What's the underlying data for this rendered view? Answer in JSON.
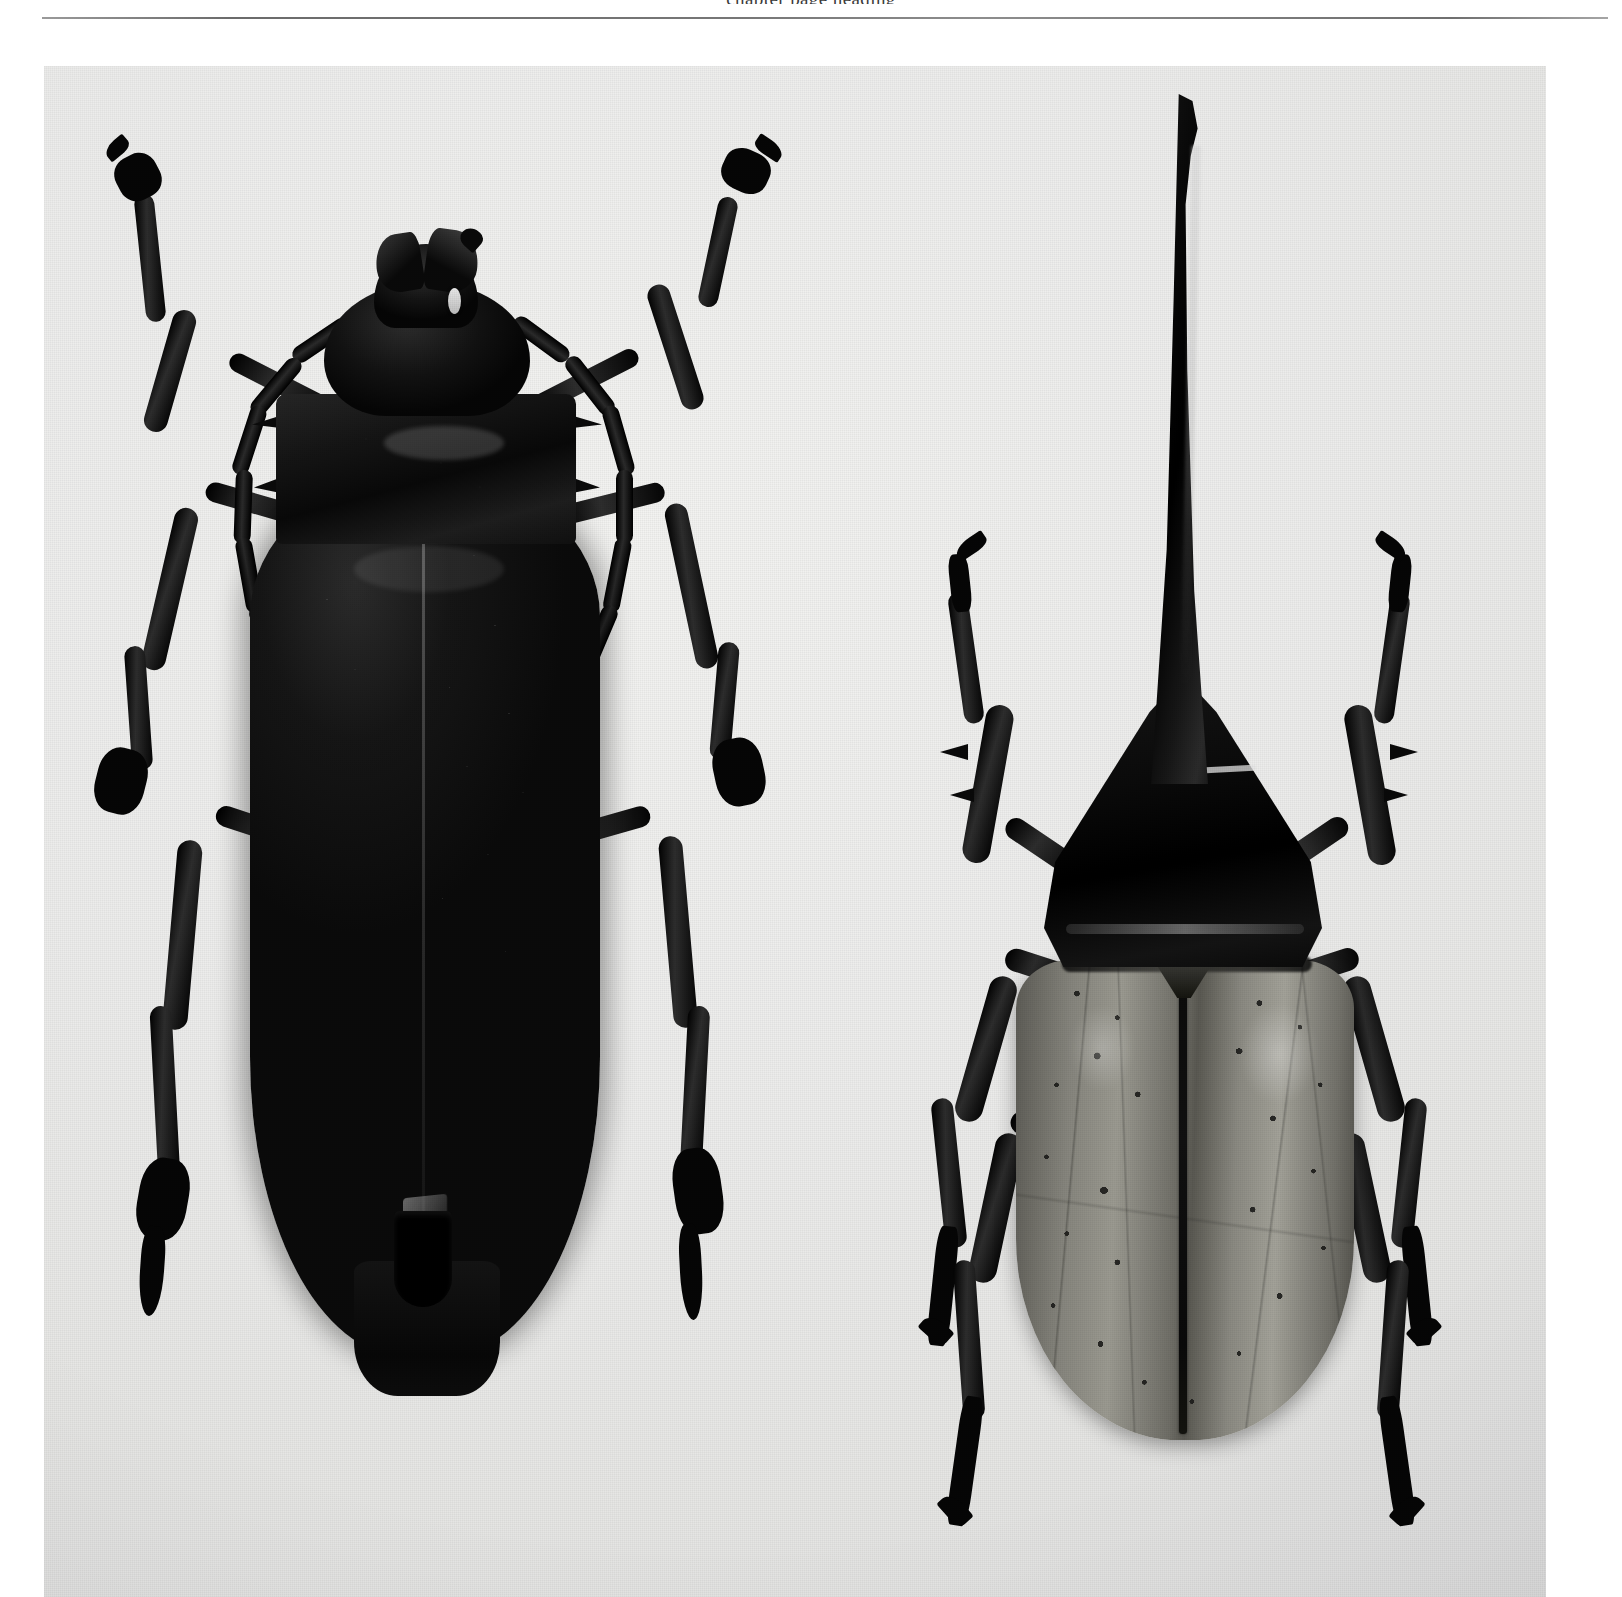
{
  "page": {
    "width": 1622,
    "height": 1597,
    "background_color": "#ffffff",
    "kind": "scanned-book-plate",
    "running_header_text": "chapter page heading",
    "header_rule_color": "#6f6f6f"
  },
  "plate": {
    "name": "beetle-comparison-photograph",
    "caption": "",
    "background_color": "#ececea",
    "medium": "black-and-white halftone photograph",
    "specimen_count": 2,
    "view": "dorsal",
    "lighting": "top-left key light"
  },
  "specimens": [
    {
      "position": "left",
      "common_name": "Longhorn beetle",
      "family": "Cerambycidae",
      "color": "#0a0a0a",
      "body_color_label": "glossy black",
      "parts": [
        {
          "name": "mandibles",
          "label": "Mandibles",
          "count": 2,
          "color": "#151515"
        },
        {
          "name": "head",
          "label": "Head",
          "color": "#121212"
        },
        {
          "name": "eye",
          "label": "Compound eye",
          "color": "#e3e3e3"
        },
        {
          "name": "antennae",
          "label": "Antennae",
          "count": 2,
          "segments": 9,
          "color": "#090909"
        },
        {
          "name": "pronotum",
          "label": "Pronotum with lateral spines",
          "spines": 4,
          "color": "#141414"
        },
        {
          "name": "elytra",
          "label": "Elytra",
          "texture": "coarsely granulate",
          "color": "#101010"
        },
        {
          "name": "suture",
          "label": "Elytral suture",
          "color": "#8c8c8c"
        },
        {
          "name": "legs",
          "label": "Legs",
          "count": 6,
          "color": "#070707"
        },
        {
          "name": "tarsi",
          "label": "Tarsi and claws",
          "count": 6,
          "color": "#060606"
        },
        {
          "name": "abdomen-tip",
          "label": "Abdomen apex",
          "color": "#0d0d0d"
        }
      ]
    },
    {
      "position": "right",
      "common_name": "Hercules beetle",
      "family": "Scarabaeidae (Dynastinae)",
      "color": "#0a0a0a",
      "body_color_label": "black horn with olive-grey elytra",
      "parts": [
        {
          "name": "thoracic-horn",
          "label": "Thoracic horn",
          "color": "#0b0b0b",
          "shape": "long, upcurved, apically hooked"
        },
        {
          "name": "pronotum",
          "label": "Pronotum",
          "color": "#0d0d0d"
        },
        {
          "name": "elytra",
          "label": "Elytra",
          "color": "#8a8981",
          "markings": "scattered black spots"
        },
        {
          "name": "elytral-spots",
          "label": "Black elytral spots",
          "count": 23,
          "color": "#1c1c1a"
        },
        {
          "name": "suture",
          "label": "Elytral suture",
          "color": "#0c0c0b"
        },
        {
          "name": "scutellum",
          "label": "Scutellum",
          "color": "#26261f"
        },
        {
          "name": "legs",
          "label": "Legs",
          "count": 6,
          "color": "#080808"
        },
        {
          "name": "tibial-spines",
          "label": "Tibial spines",
          "color": "#0a0a0a"
        },
        {
          "name": "tarsal-claws",
          "label": "Tarsal claws",
          "count": 6,
          "color": "#060606"
        }
      ]
    }
  ]
}
